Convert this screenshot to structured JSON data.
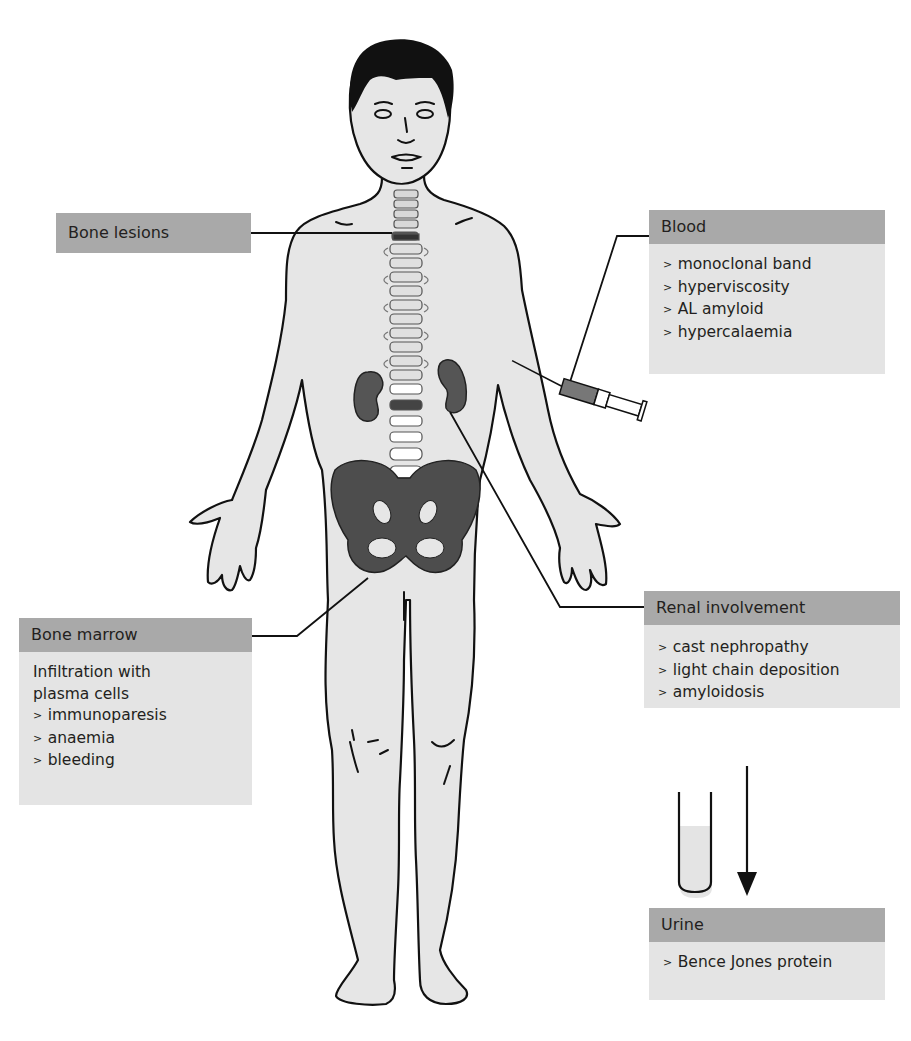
{
  "figure": {
    "colors": {
      "header_fill": "#a9a9a9",
      "body_fill": "#e4e4e4",
      "skin_fill": "#e6e6e6",
      "bone_dark": "#4a4a4a",
      "line": "#111111"
    }
  },
  "labels": {
    "bone_lesions": {
      "title": "Bone lesions"
    },
    "blood": {
      "title": "Blood",
      "items": [
        "monoclonal band",
        "hyperviscosity",
        "AL amyloid",
        "hypercalaemia"
      ]
    },
    "bone_marrow": {
      "title": "Bone marrow",
      "intro": [
        "Infiltration with",
        "plasma cells"
      ],
      "items": [
        "immunoparesis",
        "anaemia",
        "bleeding"
      ]
    },
    "renal": {
      "title": "Renal involvement",
      "items": [
        "cast nephropathy",
        "light chain deposition",
        "amyloidosis"
      ]
    },
    "urine": {
      "title": "Urine",
      "items": [
        "Bence Jones protein"
      ]
    }
  },
  "icons": {
    "syringe": "syringe-icon",
    "test_tube": "test-tube-icon",
    "arrow": "arrow-down-icon"
  }
}
